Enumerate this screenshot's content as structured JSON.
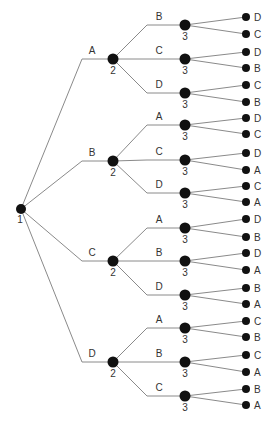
{
  "diagram": {
    "type": "tree",
    "colors": {
      "edge": "#8a8a8a",
      "node": "#111111",
      "text": "#333333"
    },
    "root": {
      "label": "1",
      "x": 21,
      "y": 209
    },
    "level1": [
      {
        "edge_label": "A",
        "knee_x": 82,
        "x": 113,
        "y": 59,
        "depth_label": "2",
        "children": [
          {
            "edge_label": "B",
            "y": 25,
            "leaves": [
              {
                "label": "D",
                "y": 17
              },
              {
                "label": "C",
                "y": 34
              }
            ]
          },
          {
            "edge_label": "C",
            "y": 59,
            "leaves": [
              {
                "label": "D",
                "y": 52
              },
              {
                "label": "B",
                "y": 68
              }
            ]
          },
          {
            "edge_label": "D",
            "y": 93,
            "leaves": [
              {
                "label": "C",
                "y": 85
              },
              {
                "label": "B",
                "y": 102
              }
            ]
          }
        ]
      },
      {
        "edge_label": "B",
        "knee_x": 82,
        "x": 113,
        "y": 161,
        "depth_label": "2",
        "children": [
          {
            "edge_label": "A",
            "y": 125,
            "leaves": [
              {
                "label": "D",
                "y": 118
              },
              {
                "label": "C",
                "y": 134
              }
            ]
          },
          {
            "edge_label": "C",
            "y": 160,
            "leaves": [
              {
                "label": "D",
                "y": 153
              },
              {
                "label": "A",
                "y": 170
              }
            ]
          },
          {
            "edge_label": "D",
            "y": 193,
            "leaves": [
              {
                "label": "C",
                "y": 186
              },
              {
                "label": "A",
                "y": 202
              }
            ]
          }
        ]
      },
      {
        "edge_label": "C",
        "knee_x": 82,
        "x": 113,
        "y": 261,
        "depth_label": "2",
        "children": [
          {
            "edge_label": "A",
            "y": 228,
            "leaves": [
              {
                "label": "D",
                "y": 219
              },
              {
                "label": "B",
                "y": 237
              }
            ]
          },
          {
            "edge_label": "B",
            "y": 261,
            "leaves": [
              {
                "label": "D",
                "y": 253
              },
              {
                "label": "A",
                "y": 270
              }
            ]
          },
          {
            "edge_label": "D",
            "y": 295,
            "leaves": [
              {
                "label": "B",
                "y": 288
              },
              {
                "label": "A",
                "y": 304
              }
            ]
          }
        ]
      },
      {
        "edge_label": "D",
        "knee_x": 82,
        "x": 113,
        "y": 362,
        "depth_label": "2",
        "children": [
          {
            "edge_label": "A",
            "y": 328,
            "leaves": [
              {
                "label": "C",
                "y": 321
              },
              {
                "label": "B",
                "y": 337
              }
            ]
          },
          {
            "edge_label": "B",
            "y": 362,
            "leaves": [
              {
                "label": "C",
                "y": 355
              },
              {
                "label": "A",
                "y": 372
              }
            ]
          },
          {
            "edge_label": "C",
            "y": 396,
            "leaves": [
              {
                "label": "B",
                "y": 389
              },
              {
                "label": "A",
                "y": 405
              }
            ]
          }
        ]
      }
    ],
    "level2": {
      "knee_x": 147,
      "x": 185,
      "depth_label": "3"
    },
    "leaf_x": 246
  }
}
